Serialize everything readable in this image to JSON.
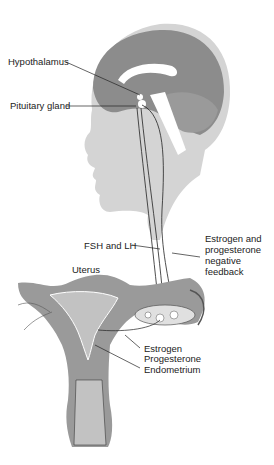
{
  "diagram": {
    "labels": {
      "hypothalamus": "Hypothalamus",
      "pituitary": "Pituitary gland",
      "fsh_lh": "FSH and LH",
      "feedback": "Estrogen and progesterone negative feedback",
      "uterus": "Uterus",
      "estrogen": "Estrogen",
      "progesterone": "Progesterone",
      "endometrium": "Endometrium"
    },
    "colors": {
      "background": "#ffffff",
      "head_silhouette": "#d4d4d4",
      "brain": "#8c8c8c",
      "brain_highlight": "#ffffff",
      "uterus_tissue": "#9a9a9a",
      "uterus_inner": "#bdbdbd",
      "line": "#222222",
      "text": "#222222"
    }
  }
}
